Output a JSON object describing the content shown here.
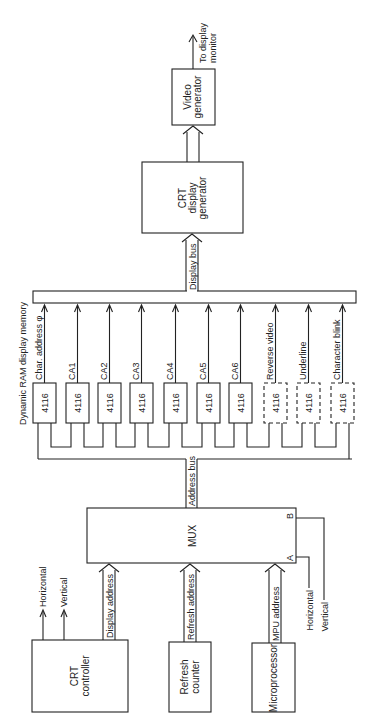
{
  "diagram": {
    "title": "Dynamic RAM display memory",
    "blocks": {
      "video_generator": [
        "Video",
        "generator"
      ],
      "crt_display_generator": [
        "CRT",
        "display",
        "generator"
      ],
      "mux": "MUX",
      "mux_port_a": "A",
      "mux_port_b": "B",
      "crt_controller": [
        "CRT",
        "controller"
      ],
      "refresh_counter": [
        "Refresh",
        "counter"
      ],
      "microprocessor": "Microprocessor"
    },
    "labels": {
      "to_display_monitor": [
        "To display",
        "monitor"
      ],
      "display_bus": "Display bus",
      "address_bus": "Address bus",
      "display_address": "Display address",
      "refresh_address": "Refresh address",
      "mpu_address": "MPU address",
      "horizontal_out": "Horizontal",
      "vertical_out": "Vertical",
      "horizontal_in": "Horizontal",
      "vertical_in": "Vertical"
    },
    "memory_chips": [
      {
        "part": "4116",
        "signal": "Char. address φ",
        "dashed": false
      },
      {
        "part": "4116",
        "signal": "CA1",
        "dashed": false
      },
      {
        "part": "4116",
        "signal": "CA2",
        "dashed": false
      },
      {
        "part": "4116",
        "signal": "CA3",
        "dashed": false
      },
      {
        "part": "4116",
        "signal": "CA4",
        "dashed": false
      },
      {
        "part": "4116",
        "signal": "CA5",
        "dashed": false
      },
      {
        "part": "4116",
        "signal": "CA6",
        "dashed": false
      },
      {
        "part": "4116",
        "signal": "Reverse video",
        "dashed": true
      },
      {
        "part": "4116",
        "signal": "Underline",
        "dashed": true
      },
      {
        "part": "4116",
        "signal": "Character blink",
        "dashed": true
      }
    ]
  }
}
